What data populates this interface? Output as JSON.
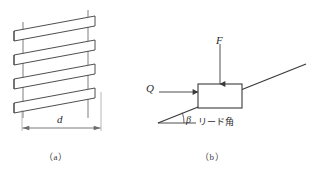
{
  "figure": {
    "title_present": false,
    "panels": [
      {
        "id": "a",
        "caption": "（a）",
        "subject": "screw-thread-helix",
        "labels": [
          {
            "name": "diameter",
            "text": "d",
            "style": "italic"
          }
        ],
        "dimension_line": {
          "label": "d",
          "arrows": "both-ends",
          "x_start": 22,
          "x_end": 101,
          "y": 128
        },
        "threads": {
          "count": 4,
          "slant_direction": "up-to-right",
          "body_left_x": 22,
          "body_right_x": 101
        },
        "guide_lines": {
          "count": 4,
          "orientation": "vertical"
        }
      },
      {
        "id": "b",
        "caption": "（b）",
        "subject": "inclined-plane-force-diagram",
        "labels": [
          {
            "name": "vertical-load",
            "text": "F",
            "style": "italic"
          },
          {
            "name": "horizontal-force",
            "text": "Q",
            "style": "italic"
          },
          {
            "name": "lead-angle-symbol",
            "text": "β",
            "style": "italic"
          },
          {
            "name": "lead-angle-text",
            "text": "リード角",
            "style": "normal"
          }
        ],
        "incline": {
          "x_start": 158,
          "y_start": 123,
          "x_end": 306,
          "y_end": 64
        },
        "block": {
          "x": 198,
          "y": 84,
          "width": 44,
          "height": 24
        },
        "force_F": {
          "direction": "down",
          "x": 220,
          "y_start": 44,
          "y_end": 84
        },
        "force_Q": {
          "direction": "right",
          "y": 92,
          "x_start": 159,
          "x_end": 198
        },
        "angle_arc": {
          "vertex_x": 158,
          "vertex_y": 123,
          "symbol": "β"
        }
      }
    ]
  },
  "colors": {
    "line": "#3a3a3a",
    "thread_fill": "#ffffff",
    "dimension": "#6b6b6b",
    "text": "#2b2b2b",
    "caption": "#3a3a3a",
    "background": "#ffffff"
  }
}
